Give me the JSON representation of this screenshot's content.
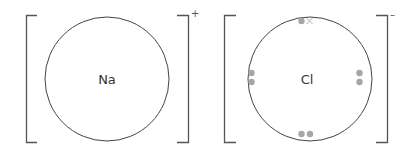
{
  "diagram": {
    "title": "",
    "colors": {
      "line": "#555555",
      "electron": "#a6a6a6",
      "text": "#333333"
    },
    "ions": [
      {
        "symbol": "Na",
        "charge": "+",
        "electrons": []
      },
      {
        "symbol": "Cl",
        "charge": "–",
        "electrons": [
          {
            "position": "top",
            "marks": [
              "dot",
              "cross"
            ]
          },
          {
            "position": "left",
            "marks": [
              "dot",
              "dot"
            ]
          },
          {
            "position": "right",
            "marks": [
              "dot",
              "dot"
            ]
          },
          {
            "position": "bottom",
            "marks": [
              "dot",
              "dot"
            ]
          }
        ]
      }
    ]
  }
}
